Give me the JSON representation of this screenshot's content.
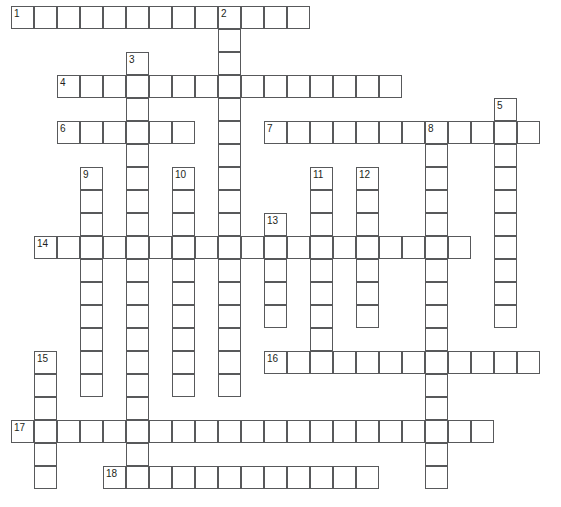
{
  "puzzle": {
    "type": "crossword-grid",
    "title": "Crossword puzzle grid",
    "cell_size": 23,
    "origin_x": 11,
    "origin_y": 6,
    "grid_cols": 24,
    "grid_rows": 22,
    "colors": {
      "cell_fill": "#ffffff",
      "cell_border": "#58595b",
      "number_text": "#231f20",
      "page_background": "#ffffff"
    },
    "across_entries": [
      {
        "number": "1",
        "col": 0,
        "row": 0,
        "length": 13
      },
      {
        "number": "4",
        "col": 2,
        "row": 3,
        "length": 15
      },
      {
        "number": "6",
        "col": 2,
        "row": 5,
        "length": 6
      },
      {
        "number": "7",
        "col": 11,
        "row": 5,
        "length": 12
      },
      {
        "number": "14",
        "col": 1,
        "row": 10,
        "length": 19
      },
      {
        "number": "16",
        "col": 11,
        "row": 15,
        "length": 12
      },
      {
        "number": "17",
        "col": 0,
        "row": 18,
        "length": 21
      },
      {
        "number": "18",
        "col": 4,
        "row": 20,
        "length": 12
      }
    ],
    "down_entries": [
      {
        "number": "2",
        "col": 9,
        "row": 0,
        "length": 17
      },
      {
        "number": "3",
        "col": 5,
        "row": 2,
        "length": 19
      },
      {
        "number": "5",
        "col": 21,
        "row": 4,
        "length": 10
      },
      {
        "number": "8",
        "col": 18,
        "row": 5,
        "length": 16
      },
      {
        "number": "9",
        "col": 3,
        "row": 7,
        "length": 10
      },
      {
        "number": "10",
        "col": 7,
        "row": 7,
        "length": 10
      },
      {
        "number": "11",
        "col": 13,
        "row": 7,
        "length": 9
      },
      {
        "number": "12",
        "col": 15,
        "row": 7,
        "length": 7
      },
      {
        "number": "13",
        "col": 11,
        "row": 9,
        "length": 5
      },
      {
        "number": "15",
        "col": 1,
        "row": 15,
        "length": 6
      }
    ],
    "numbers_visible": [
      "1",
      "2",
      "3",
      "4",
      "5",
      "6",
      "7",
      "8",
      "9",
      "10",
      "11",
      "12",
      "13",
      "14",
      "15",
      "16",
      "17",
      "18"
    ]
  }
}
